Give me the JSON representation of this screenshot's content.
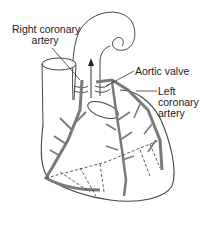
{
  "diagram": {
    "labels": {
      "right_coronary_line1": "Right coronary",
      "right_coronary_line2": "artery",
      "aortic_valve": "Aortic valve",
      "left_coronary_line1": "Left",
      "left_coronary_line2": "coronary",
      "left_coronary_line3": "artery"
    },
    "colors": {
      "outline": "#444444",
      "artery": "#7a7a7a",
      "text": "#222222",
      "background": "#ffffff"
    }
  }
}
